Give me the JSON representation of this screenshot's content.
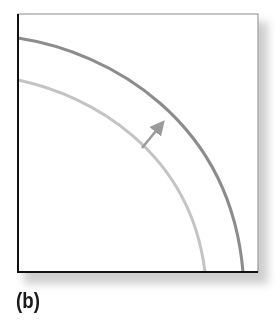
{
  "figure": {
    "panel_label": "(b)",
    "colors": {
      "frame": "#8a8a8a",
      "axis": "#111111",
      "outer_curve": "#8c8c8c",
      "inner_curve": "#c4c4c4",
      "arrow": "#9a9a9a",
      "shadow": "#cfcfcf"
    },
    "curves": [
      {
        "name": "original-frontier",
        "description": "inner curve",
        "start": [
          18,
          80
        ],
        "end": [
          205,
          272
        ]
      },
      {
        "name": "shifted-frontier",
        "description": "outer curve",
        "start": [
          18,
          38
        ],
        "end": [
          243,
          272
        ]
      }
    ],
    "arrow": {
      "direction": "outward",
      "from": [
        142,
        148
      ],
      "to": [
        164,
        121
      ]
    }
  }
}
